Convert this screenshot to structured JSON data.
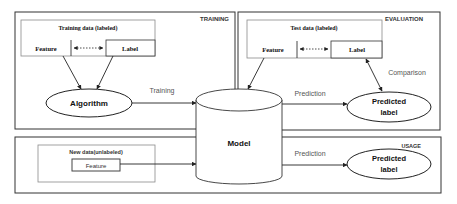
{
  "colors": {
    "stroke": "#333333",
    "inner_stroke": "#8a8a8a",
    "text": "#111111",
    "edge_label": "#555555",
    "background": "#ffffff"
  },
  "sections": {
    "training": {
      "label": "TRAINING",
      "data_box": {
        "title": "Training data (labeled)",
        "feature": "Feature",
        "label": "Label"
      },
      "algorithm": "Algorithm",
      "edge_to_model": "Training"
    },
    "evaluation": {
      "label": "EVALUATION",
      "data_box": {
        "title": "Test data (labeled)",
        "feature": "Feature",
        "label": "Label"
      },
      "edge_prediction": "Prediction",
      "edge_comparison": "Comparison",
      "output": [
        "Predicted",
        "label"
      ]
    },
    "usage": {
      "label": "USAGE",
      "data_box": {
        "title": "New data(unlabeled)",
        "feature": "Feature"
      },
      "edge_prediction": "Prediction",
      "output": [
        "Predicted",
        "label"
      ]
    }
  },
  "model": "Model"
}
